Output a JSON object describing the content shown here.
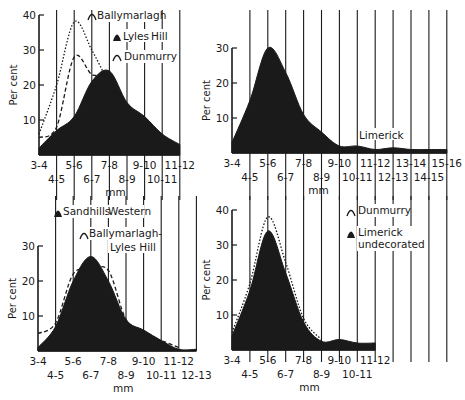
{
  "figure": {
    "ylabel": "Per cent",
    "xlabel": "mm",
    "ink_color": "#1a1a1a",
    "background": "#ffffff"
  },
  "chart_data": [
    {
      "type": "area",
      "panel": "top-left",
      "xlabel": "mm",
      "ylabel": "Per cent",
      "ylim": [
        0,
        40
      ],
      "yticks": [
        10,
        20,
        30,
        40
      ],
      "categories": [
        "3-4",
        "4-5",
        "5-6",
        "6-7",
        "7-8",
        "8-9",
        "9-10",
        "10-11",
        "11-12"
      ],
      "series": [
        {
          "name": "Lyles Hill",
          "style": "filled",
          "values": [
            2,
            7,
            11,
            21,
            24,
            15,
            11,
            6,
            3
          ]
        },
        {
          "name": "Ballymarlagh",
          "style": "dashed",
          "values": [
            5,
            8,
            28,
            23,
            22,
            10,
            2,
            3,
            null
          ]
        },
        {
          "name": "Dunmurry",
          "style": "dotted",
          "values": [
            6,
            20,
            38,
            30,
            20,
            9,
            2,
            null,
            null
          ]
        }
      ],
      "legend": [
        "Ballymarlagh",
        "Lyles Hill",
        "Dunmurry"
      ],
      "grid": "vertical"
    },
    {
      "type": "area",
      "panel": "top-right",
      "xlabel": "mm",
      "ylabel": "Per cent",
      "ylim": [
        0,
        30
      ],
      "yticks": [
        10,
        20,
        30
      ],
      "categories": [
        "3-4",
        "4-5",
        "5-6",
        "6-7",
        "7-8",
        "8-9",
        "9-10",
        "10-11",
        "11-12",
        "12-13",
        "13-14",
        "14-15",
        "15-16"
      ],
      "series": [
        {
          "name": "Limerick",
          "style": "filled",
          "values": [
            3,
            15,
            30,
            23,
            11,
            6,
            2,
            2,
            1,
            1.5,
            1,
            1,
            1
          ]
        }
      ],
      "legend": [
        "Limerick"
      ],
      "grid": "vertical"
    },
    {
      "type": "area",
      "panel": "bottom-left",
      "xlabel": "mm",
      "ylabel": "Per cent",
      "ylim": [
        0,
        30
      ],
      "yticks": [
        10,
        20,
        30
      ],
      "categories": [
        "3-4",
        "4-5",
        "5-6",
        "6-7",
        "7-8",
        "8-9",
        "9-10",
        "10-11",
        "11-12",
        "12-13"
      ],
      "series": [
        {
          "name": "Sandhills Western",
          "style": "filled",
          "values": [
            1,
            7,
            20,
            27,
            20,
            9,
            6,
            3,
            0.5,
            0.5
          ]
        },
        {
          "name": "Ballymarlagh-Lyles Hill",
          "style": "dashed",
          "values": [
            5,
            8,
            22,
            23,
            23,
            9,
            5,
            3,
            1,
            null
          ]
        }
      ],
      "legend": [
        "Sandhills Western",
        "Ballymarlagh-Lyles Hill"
      ],
      "grid": "vertical"
    },
    {
      "type": "area",
      "panel": "bottom-right",
      "xlabel": "mm",
      "ylabel": "Per cent",
      "ylim": [
        0,
        40
      ],
      "yticks": [
        10,
        20,
        30,
        40
      ],
      "categories": [
        "3-4",
        "4-5",
        "5-6",
        "6-7",
        "7-8",
        "8-9",
        "9-10",
        "10-11",
        "11-12"
      ],
      "series": [
        {
          "name": "Limerick undecorated",
          "style": "filled",
          "values": [
            4,
            17,
            34,
            22,
            8,
            2.5,
            3,
            2,
            2
          ]
        },
        {
          "name": "Dunmurry",
          "style": "dotted",
          "values": [
            5,
            19,
            38,
            25,
            9,
            3,
            null,
            null,
            null
          ]
        }
      ],
      "legend": [
        "Dunmurry",
        "Limerick undecorated"
      ],
      "grid": "vertical"
    }
  ],
  "legends": {
    "tl": {
      "a": "Ballymarlagh",
      "b1": "Lyles",
      "b2": "Hill",
      "c": "Dunmurry"
    },
    "tr": {
      "a": "Limerick"
    },
    "bl": {
      "a1": "Sandhills",
      "a2": "Western",
      "b1": "Ballymarlagh-",
      "b2": "Lyles  Hill"
    },
    "br": {
      "a": "Dunmurry",
      "b1": "Limerick",
      "b2": "undecorated"
    }
  }
}
